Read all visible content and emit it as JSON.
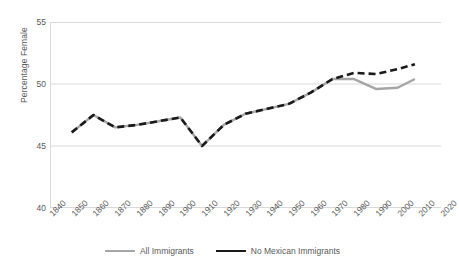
{
  "chart_data": {
    "type": "line",
    "title": "",
    "xlabel": "",
    "ylabel": "Percentage Female",
    "xlim": [
      1840,
      2020
    ],
    "ylim": [
      40,
      55
    ],
    "y_ticks": [
      55,
      50,
      45,
      40
    ],
    "x_ticks": [
      1840,
      1850,
      1860,
      1870,
      1880,
      1890,
      1900,
      1910,
      1920,
      1930,
      1940,
      1950,
      1960,
      1970,
      1980,
      1990,
      2000,
      2010,
      2020
    ],
    "grid": "horizontal",
    "legend_position": "bottom-center",
    "series": [
      {
        "name": "All Immigrants",
        "color": "#a6a6a6",
        "style": "solid",
        "x": [
          1850,
          1860,
          1870,
          1880,
          1890,
          1900,
          1910,
          1920,
          1930,
          1940,
          1950,
          1960,
          1970,
          1980,
          1990,
          2000,
          2008
        ],
        "values": [
          46.1,
          47.5,
          46.5,
          46.7,
          47.0,
          47.3,
          45.0,
          46.7,
          47.6,
          48.0,
          48.4,
          49.3,
          50.4,
          50.4,
          49.6,
          49.7,
          50.4
        ]
      },
      {
        "name": "No Mexican Immigrants",
        "color": "#1a1a1a",
        "style": "dashed",
        "x": [
          1850,
          1860,
          1870,
          1880,
          1890,
          1900,
          1910,
          1920,
          1930,
          1940,
          1950,
          1960,
          1970,
          1980,
          1990,
          2000,
          2008
        ],
        "values": [
          46.1,
          47.5,
          46.5,
          46.7,
          47.0,
          47.3,
          45.0,
          46.7,
          47.6,
          48.0,
          48.4,
          49.3,
          50.4,
          50.9,
          50.8,
          51.2,
          51.6
        ]
      }
    ]
  },
  "axis": {
    "y_title": "Percentage Female"
  },
  "legend": {
    "items": [
      {
        "label": "All Immigrants"
      },
      {
        "label": "No Mexican Immigrants"
      }
    ]
  }
}
